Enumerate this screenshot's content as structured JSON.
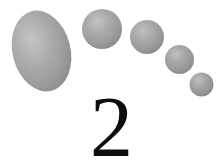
{
  "canvas": {
    "width": 224,
    "height": 163,
    "background_color": "#ffffff"
  },
  "figure": {
    "name": "footprint-with-numeral",
    "numeral": {
      "text": "2",
      "color": "#0d0d0d",
      "font_size_px": 86,
      "left_px": 88,
      "top_px": 84,
      "right_px": 135,
      "bottom_px": 153
    },
    "palette": {
      "highlight": "#c2c2c2",
      "midtone": "#a9a9a9",
      "shadow": "#8a8a8a",
      "edge": "#7d7d7d",
      "background": "#ffffff",
      "numeral_ink": "#0d0d0d"
    },
    "shapes": [
      {
        "id": "sole-oval",
        "label": "large-oval",
        "type": "ellipse",
        "cx": 41.5,
        "cy": 51.0,
        "rx": 29.0,
        "ry": 41.0,
        "rotation_deg": -14,
        "highlight_cx_pct": 38,
        "highlight_cy_pct": 34,
        "fill_light": "#c4c4c4",
        "fill_mid": "#ababab",
        "fill_dark": "#8b8b8b"
      },
      {
        "id": "toe-1",
        "label": "toe-circle-large",
        "type": "circle",
        "cx": 102.0,
        "cy": 29.0,
        "r": 20.0,
        "highlight_cx_pct": 38,
        "highlight_cy_pct": 32,
        "fill_light": "#c2c2c2",
        "fill_mid": "#a8a8a8",
        "fill_dark": "#878787"
      },
      {
        "id": "toe-2",
        "label": "toe-circle-second",
        "type": "circle",
        "cx": 147.0,
        "cy": 37.0,
        "r": 17.0,
        "highlight_cx_pct": 38,
        "highlight_cy_pct": 32,
        "fill_light": "#c0c0c0",
        "fill_mid": "#a6a6a6",
        "fill_dark": "#868686"
      },
      {
        "id": "toe-3",
        "label": "toe-circle-third",
        "type": "circle",
        "cx": 179.5,
        "cy": 59.5,
        "r": 14.5,
        "highlight_cx_pct": 38,
        "highlight_cy_pct": 32,
        "fill_light": "#bfbfbf",
        "fill_mid": "#a5a5a5",
        "fill_dark": "#858585"
      },
      {
        "id": "toe-4",
        "label": "toe-circle-smallest",
        "type": "circle",
        "cx": 201.5,
        "cy": 84.5,
        "r": 12.0,
        "highlight_cx_pct": 38,
        "highlight_cy_pct": 32,
        "fill_light": "#bdbdbd",
        "fill_mid": "#a4a4a4",
        "fill_dark": "#848484"
      }
    ]
  }
}
